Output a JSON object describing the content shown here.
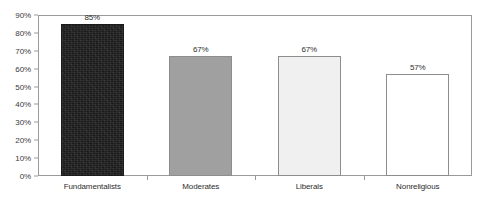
{
  "chart_data": {
    "type": "bar",
    "title": "",
    "subtitle": "",
    "xlabel": "",
    "ylabel": "",
    "categories": [
      "Fundamentalists",
      "Moderates",
      "Liberals",
      "Nonreligious"
    ],
    "values": [
      85,
      67,
      67,
      57
    ],
    "value_labels": [
      "85%",
      "67%",
      "67%",
      "57%"
    ],
    "ylim": [
      0,
      90
    ],
    "ytick_values": [
      0,
      10,
      20,
      30,
      40,
      50,
      60,
      70,
      80,
      90
    ],
    "ytick_labels": [
      "0%",
      "10%",
      "20%",
      "30%",
      "40%",
      "50%",
      "60%",
      "70%",
      "80%",
      "90%"
    ],
    "grid": false,
    "legend": "none",
    "bar_colors": [
      "#1b1b1b",
      "#a0a0a0",
      "#f0f0f0",
      "#ffffff"
    ],
    "bar_border_color": "#8d8d8d",
    "axis_color": "#9a9a9a",
    "plot_background": "#ffffff"
  }
}
